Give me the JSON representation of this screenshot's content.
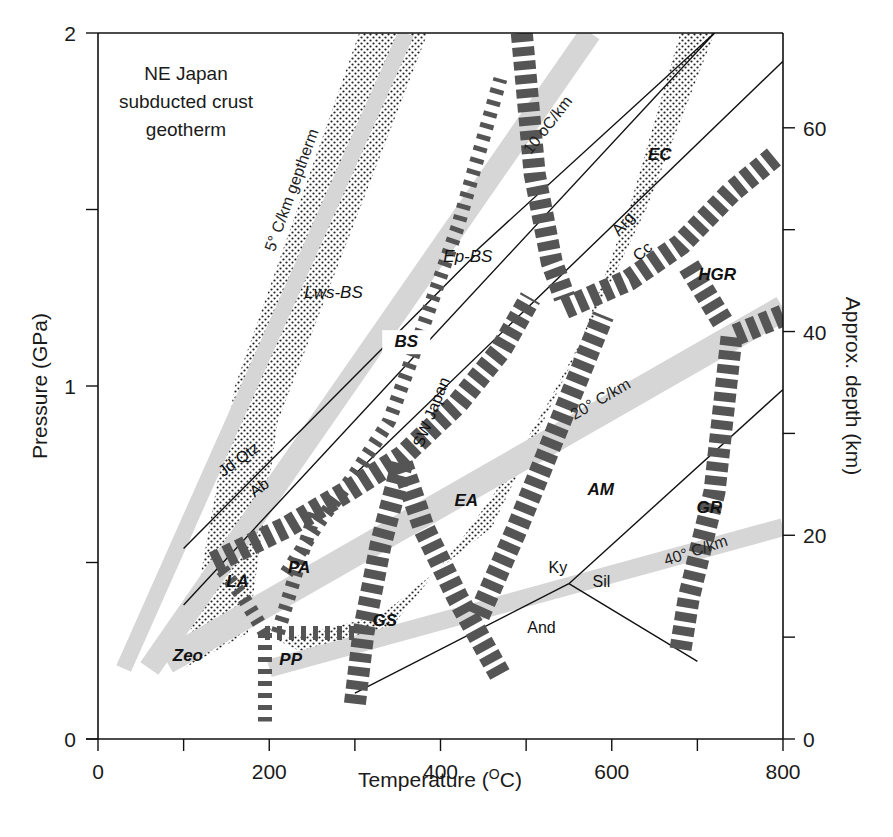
{
  "chart_data": {
    "type": "line",
    "title": "",
    "xlabel": "Temperature (oC)",
    "ylabel": "Pressure (GPa)",
    "y2label": "Approx. depth (km)",
    "xlim": [
      0,
      800
    ],
    "ylim": [
      0,
      2
    ],
    "y2lim": [
      0,
      70
    ],
    "grid": false,
    "x_ticks": [
      0,
      100,
      200,
      300,
      400,
      500,
      600,
      700,
      800
    ],
    "x_tick_labels": [
      "0",
      "",
      "200",
      "",
      "400",
      "",
      "600",
      "",
      "800"
    ],
    "y_ticks": [
      0,
      0.5,
      1,
      1.5,
      2
    ],
    "y_tick_labels": [
      "0",
      "",
      "1",
      "",
      "2"
    ],
    "y2_ticks": [
      0,
      10,
      20,
      30,
      40,
      50,
      60
    ],
    "y2_tick_labels": [
      "0",
      "",
      "20",
      "",
      "40",
      "",
      "60"
    ],
    "annotations": {
      "ne_japan": [
        "NE Japan",
        "subducted crust",
        "geotherm"
      ],
      "sw_japan": "SW Japan",
      "gradients": [
        {
          "label": "5° C/km geptherm",
          "band": [
            [
              30,
              0.2
            ],
            [
              360,
              2.0
            ]
          ],
          "width": 16,
          "text_at": [
            232,
            1.55
          ],
          "angle": -70
        },
        {
          "label": "10 oC/km",
          "band": [
            [
              60,
              0.2
            ],
            [
              575,
              2.0
            ]
          ],
          "width": 22,
          "text_at": [
            530,
            1.73
          ],
          "angle": -52
        },
        {
          "label": "20° C/km",
          "band": [
            [
              80,
              0.22
            ],
            [
              800,
              1.22
            ]
          ],
          "width": 26,
          "text_at": [
            590,
            0.95
          ],
          "angle": -30
        },
        {
          "label": "40° C/km",
          "band": [
            [
              200,
              0.2
            ],
            [
              800,
              0.6
            ]
          ],
          "width": 18,
          "text_at": [
            700,
            0.52
          ],
          "angle": -18
        }
      ],
      "minerals": [
        {
          "label": "Jd Qtz",
          "at": [
            168,
            0.78
          ],
          "angle": -36
        },
        {
          "label": "Ab",
          "at": [
            192,
            0.7
          ],
          "angle": -36
        },
        {
          "label": "Arg",
          "at": [
            618,
            1.45
          ],
          "angle": -48
        },
        {
          "label": "Cc",
          "at": [
            640,
            1.37
          ],
          "angle": -40
        },
        {
          "label": "Ky",
          "at": [
            537,
            0.47
          ],
          "angle": 0
        },
        {
          "label": "Sil",
          "at": [
            588,
            0.43
          ],
          "angle": 0
        },
        {
          "label": "And",
          "at": [
            518,
            0.3
          ],
          "angle": 0
        }
      ]
    },
    "facies": [
      {
        "label": "Zeo",
        "at": [
          105,
          0.22
        ],
        "style": "bold"
      },
      {
        "label": "PP",
        "at": [
          225,
          0.21
        ],
        "style": "bold"
      },
      {
        "label": "LA",
        "at": [
          163,
          0.43
        ],
        "style": "bold"
      },
      {
        "label": "PA",
        "at": [
          235,
          0.47
        ],
        "style": "bold"
      },
      {
        "label": "GS",
        "at": [
          335,
          0.32
        ],
        "style": "bold"
      },
      {
        "label": "EA",
        "at": [
          430,
          0.66
        ],
        "style": "bold"
      },
      {
        "label": "AM",
        "at": [
          587,
          0.69
        ],
        "style": "bold"
      },
      {
        "label": "GR",
        "at": [
          714,
          0.64
        ],
        "style": "bold"
      },
      {
        "label": "HGR",
        "at": [
          723,
          1.3
        ],
        "style": "bold"
      },
      {
        "label": "EC",
        "at": [
          656,
          1.64
        ],
        "style": "bold"
      },
      {
        "label": "BS",
        "at": [
          360,
          1.11
        ],
        "style": "bold"
      },
      {
        "label": "Ep-BS",
        "at": [
          432,
          1.35
        ],
        "style": "light"
      },
      {
        "label": "Lws-BS",
        "at": [
          275,
          1.25
        ],
        "style": "light"
      }
    ],
    "boundaries": [
      {
        "name": "Jd+Qtz=Ab",
        "points": [
          [
            100,
            0.54
          ],
          [
            440,
            1.37
          ]
        ]
      },
      {
        "name": "Arg=Cc (upper)",
        "points": [
          [
            100,
            0.38
          ],
          [
            720,
            2.0
          ]
        ]
      },
      {
        "name": "reaction line",
        "points": [
          [
            440,
            1.38
          ],
          [
            720,
            2.0
          ]
        ]
      },
      {
        "name": "Cc boundary",
        "points": [
          [
            300,
            0.75
          ],
          [
            800,
            1.92
          ]
        ]
      },
      {
        "name": "Ky-Sil",
        "points": [
          [
            550,
            0.44
          ],
          [
            800,
            0.99
          ]
        ]
      },
      {
        "name": "Ky-And",
        "points": [
          [
            300,
            0.13
          ],
          [
            550,
            0.44
          ]
        ]
      },
      {
        "name": "And-Sil",
        "points": [
          [
            550,
            0.44
          ],
          [
            700,
            0.22
          ]
        ]
      }
    ],
    "facies_boundaries": [
      {
        "name": "LA-BS lower",
        "weight": "heavy",
        "points": [
          [
            135,
            0.5
          ],
          [
            220,
            0.6
          ],
          [
            290,
            0.7
          ],
          [
            355,
            0.8
          ],
          [
            420,
            0.95
          ],
          [
            470,
            1.1
          ],
          [
            505,
            1.25
          ]
        ]
      },
      {
        "name": "BS-GS vertical",
        "weight": "heavy",
        "points": [
          [
            300,
            0.1
          ],
          [
            310,
            0.3
          ],
          [
            330,
            0.55
          ],
          [
            355,
            0.78
          ]
        ]
      },
      {
        "name": "GS-EA",
        "weight": "heavy",
        "points": [
          [
            355,
            0.78
          ],
          [
            380,
            0.6
          ],
          [
            420,
            0.4
          ],
          [
            470,
            0.18
          ]
        ]
      },
      {
        "name": "EA-AM",
        "weight": "heavy",
        "points": [
          [
            445,
            0.35
          ],
          [
            490,
            0.6
          ],
          [
            540,
            0.9
          ],
          [
            590,
            1.2
          ]
        ]
      },
      {
        "name": "EC-BS",
        "weight": "heavy",
        "points": [
          [
            495,
            2.0
          ],
          [
            510,
            1.6
          ],
          [
            530,
            1.35
          ],
          [
            545,
            1.25
          ]
        ]
      },
      {
        "name": "EC-HGR",
        "weight": "heavy",
        "points": [
          [
            545,
            1.22
          ],
          [
            620,
            1.3
          ],
          [
            680,
            1.4
          ],
          [
            740,
            1.55
          ],
          [
            790,
            1.65
          ]
        ]
      },
      {
        "name": "HGR-GR",
        "weight": "heavy",
        "points": [
          [
            690,
            1.34
          ],
          [
            730,
            1.18
          ]
        ]
      },
      {
        "name": "GR-AM",
        "weight": "heavy",
        "points": [
          [
            800,
            1.2
          ],
          [
            740,
            1.14
          ],
          [
            720,
            0.7
          ],
          [
            690,
            0.4
          ],
          [
            680,
            0.25
          ]
        ]
      },
      {
        "name": "Lws-Ep",
        "weight": "light",
        "points": [
          [
            220,
            0.47
          ],
          [
            260,
            0.62
          ],
          [
            300,
            0.75
          ],
          [
            340,
            0.9
          ],
          [
            370,
            1.1
          ],
          [
            420,
            1.45
          ],
          [
            470,
            1.87
          ]
        ]
      },
      {
        "name": "LA-Zeo",
        "weight": "light",
        "points": [
          [
            145,
            0.48
          ],
          [
            170,
            0.4
          ],
          [
            195,
            0.3
          ]
        ]
      },
      {
        "name": "PP-Zeo",
        "weight": "light",
        "points": [
          [
            195,
            0.3
          ],
          [
            195,
            0.05
          ]
        ]
      },
      {
        "name": "PP-PA",
        "weight": "light",
        "points": [
          [
            195,
            0.3
          ],
          [
            300,
            0.3
          ]
        ]
      },
      {
        "name": "PA-LA",
        "weight": "light",
        "points": [
          [
            210,
            0.3
          ],
          [
            235,
            0.5
          ],
          [
            255,
            0.65
          ]
        ]
      }
    ],
    "stippled_regions": [
      {
        "name": "NE Japan wedge",
        "points": [
          [
            160,
            1.0
          ],
          [
            305,
            2.0
          ],
          [
            385,
            2.0
          ],
          [
            210,
            0.9
          ],
          [
            175,
            0.3
          ],
          [
            100,
            0.2
          ]
        ]
      },
      {
        "name": "SW Japan band",
        "points": [
          [
            210,
            0.28
          ],
          [
            330,
            0.35
          ],
          [
            460,
            0.6
          ],
          [
            560,
            1.1
          ],
          [
            620,
            1.5
          ],
          [
            680,
            2.0
          ],
          [
            720,
            2.0
          ],
          [
            640,
            1.5
          ],
          [
            580,
            1.2
          ],
          [
            525,
            0.95
          ],
          [
            470,
            0.72
          ],
          [
            420,
            0.55
          ],
          [
            330,
            0.28
          ],
          [
            260,
            0.22
          ]
        ]
      }
    ]
  },
  "axes": {
    "x_title": "Temperature (",
    "x_title_sup": "O",
    "x_title_end": "C)",
    "y_title": "Pressure (GPa)",
    "y2_title": "Approx. depth (km)"
  }
}
